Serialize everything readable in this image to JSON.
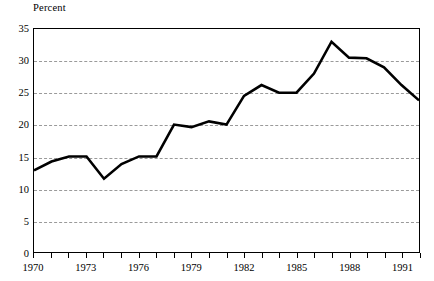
{
  "chart_data": {
    "type": "line",
    "title": "",
    "subtitle": "",
    "ylabel": "Percent",
    "xlabel": "",
    "ylim": [
      0,
      35
    ],
    "xlim": [
      1970,
      1992
    ],
    "grid": true,
    "legend": "none",
    "y_ticks": [
      35,
      30,
      25,
      20,
      15,
      10,
      5,
      0
    ],
    "y_tick_labels": [
      "35",
      "30",
      "25",
      "20",
      "15",
      "10",
      "5",
      "0"
    ],
    "x_tick_labels": [
      "1970",
      "1973",
      "1976",
      "1979",
      "1982",
      "1985",
      "1988",
      "1991"
    ],
    "x_tick_years": [
      1970,
      1973,
      1976,
      1979,
      1982,
      1985,
      1988,
      1991
    ],
    "x_minor_ticks_every": 1,
    "series": [
      {
        "name": "Percent",
        "color": "#000000",
        "x": [
          1970,
          1971,
          1972,
          1973,
          1974,
          1975,
          1976,
          1977,
          1978,
          1979,
          1980,
          1981,
          1982,
          1983,
          1984,
          1985,
          1986,
          1987,
          1988,
          1989,
          1990,
          1991,
          1992
        ],
        "values": [
          12.8,
          14.2,
          15.0,
          15.0,
          11.5,
          13.8,
          15.0,
          15.0,
          20.0,
          19.6,
          20.5,
          20.0,
          24.5,
          26.2,
          25.0,
          25.0,
          28.0,
          33.0,
          30.5,
          30.4,
          29.0,
          26.2,
          23.8
        ]
      }
    ]
  }
}
